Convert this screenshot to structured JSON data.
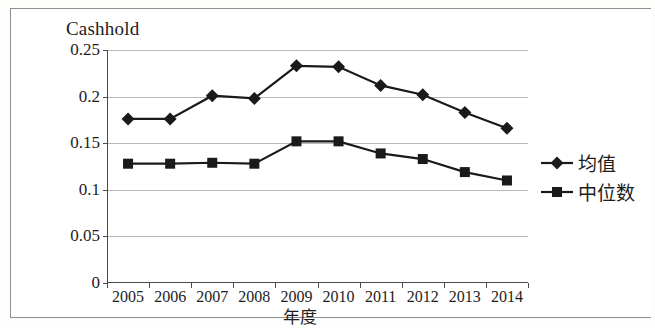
{
  "chart_data": {
    "type": "line",
    "title": "Cashhold",
    "xlabel": "年度",
    "ylabel": "",
    "categories": [
      "2005",
      "2006",
      "2007",
      "2008",
      "2009",
      "2010",
      "2011",
      "2012",
      "2013",
      "2014"
    ],
    "series": [
      {
        "name": "均值",
        "marker": "diamond",
        "values": [
          0.176,
          0.176,
          0.201,
          0.198,
          0.233,
          0.232,
          0.212,
          0.202,
          0.183,
          0.166
        ]
      },
      {
        "name": "中位数",
        "marker": "square",
        "values": [
          0.128,
          0.128,
          0.129,
          0.128,
          0.152,
          0.152,
          0.139,
          0.133,
          0.119,
          0.11
        ]
      }
    ],
    "ylim": [
      0,
      0.25
    ],
    "yticks": [
      "0",
      "0.05",
      "0.1",
      "0.15",
      "0.2",
      "0.25"
    ],
    "ytick_values": [
      0,
      0.05,
      0.1,
      0.15,
      0.2,
      0.25
    ],
    "grid": true,
    "legend_position": "right",
    "colors": {
      "series": "#1a1a1a",
      "gridline": "#b9b9b9",
      "axis": "#4a4a4a",
      "background": "#ffffff",
      "text": "#1d1d1d"
    }
  }
}
